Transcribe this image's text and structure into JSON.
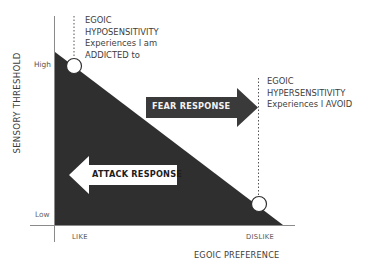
{
  "diagram": {
    "type": "sensory-threshold-vs-egoic-preference",
    "colors": {
      "triangle_fill": "#2f2f2f",
      "axis": "#8a8a8a",
      "fear_arrow": "#3a3a3a",
      "attack_arrow": "#ffffff",
      "text": "#3d3d3d"
    },
    "y_axis": {
      "title": "SENSORY THRESHOLD",
      "high_label": "High",
      "low_label": "Low"
    },
    "x_axis": {
      "title": "EGOIC PREFERENCE",
      "left_label": "LIKE",
      "right_label": "DISLIKE"
    },
    "annotations": {
      "hyposensitivity": {
        "lines": [
          "EGOIC",
          "HYPOSENSITIVITY",
          "Experiences I am",
          "ADDICTED to"
        ]
      },
      "hypersensitivity": {
        "lines": [
          "EGOIC",
          "HYPERSENSITIVITY",
          "Experiences I AVOID"
        ]
      }
    },
    "arrows": {
      "fear": {
        "label": "FEAR RESPONSE",
        "direction": "right"
      },
      "attack": {
        "label": "ATTACK RESPONSE",
        "direction": "left"
      }
    }
  }
}
